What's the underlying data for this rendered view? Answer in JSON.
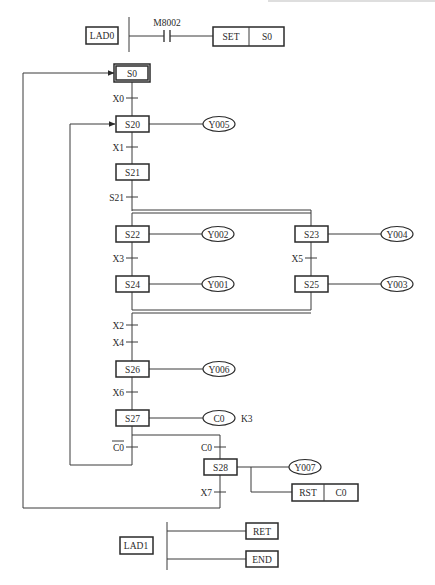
{
  "header_rule": {
    "x1": 268,
    "x2": 435,
    "y": 1
  },
  "lad0": {
    "label": "LAD0",
    "contact": "M8002",
    "instr": {
      "op": "SET",
      "operand": "S0"
    }
  },
  "lad1": {
    "label": "LAD1",
    "outputs": [
      "RET",
      "END"
    ]
  },
  "steps": [
    {
      "id": "S0",
      "x": 116,
      "y": 66,
      "w": 32,
      "h": 14,
      "initial": true
    },
    {
      "id": "S20",
      "x": 116,
      "y": 116,
      "w": 33,
      "h": 16
    },
    {
      "id": "S21",
      "x": 116,
      "y": 164,
      "w": 33,
      "h": 16
    },
    {
      "id": "S22",
      "x": 116,
      "y": 226,
      "w": 33,
      "h": 16
    },
    {
      "id": "S23",
      "x": 295,
      "y": 226,
      "w": 33,
      "h": 16
    },
    {
      "id": "S24",
      "x": 116,
      "y": 276,
      "w": 33,
      "h": 16
    },
    {
      "id": "S25",
      "x": 295,
      "y": 276,
      "w": 33,
      "h": 16
    },
    {
      "id": "S26",
      "x": 116,
      "y": 361,
      "w": 33,
      "h": 16
    },
    {
      "id": "S27",
      "x": 116,
      "y": 410,
      "w": 33,
      "h": 16
    },
    {
      "id": "S28",
      "x": 204,
      "y": 459,
      "w": 33,
      "h": 16
    }
  ],
  "outputs": [
    {
      "step": "S20",
      "label": "Y005",
      "cx": 219,
      "cy": 124
    },
    {
      "step": "S22",
      "label": "Y002",
      "cx": 218,
      "cy": 234
    },
    {
      "step": "S23",
      "label": "Y004",
      "cx": 397,
      "cy": 234
    },
    {
      "step": "S24",
      "label": "Y001",
      "cx": 218,
      "cy": 284
    },
    {
      "step": "S25",
      "label": "Y003",
      "cx": 397,
      "cy": 284
    },
    {
      "step": "S26",
      "label": "Y006",
      "cx": 219,
      "cy": 369
    },
    {
      "step": "S27",
      "label": "C0",
      "cx": 219,
      "cy": 418,
      "extra": "K3"
    },
    {
      "step": "S28",
      "label": "Y007",
      "cx": 305,
      "cy": 467
    }
  ],
  "rst_instr": {
    "op": "RST",
    "operand": "C0"
  },
  "transitions": [
    {
      "label": "X0",
      "x": 132,
      "y": 98
    },
    {
      "label": "X1",
      "x": 132,
      "y": 147
    },
    {
      "label": "S21",
      "x": 132,
      "y": 197
    },
    {
      "label": "X3",
      "x": 132,
      "y": 258
    },
    {
      "label": "X5",
      "x": 311,
      "y": 258
    },
    {
      "label": "X2",
      "x": 132,
      "y": 325
    },
    {
      "label": "X4",
      "x": 132,
      "y": 342
    },
    {
      "label": "X6",
      "x": 132,
      "y": 392
    },
    {
      "label": "C0",
      "x": 132,
      "y": 447,
      "negated": true
    },
    {
      "label": "C0",
      "x": 220,
      "y": 447
    },
    {
      "label": "X7",
      "x": 220,
      "y": 492
    }
  ],
  "caption": ""
}
